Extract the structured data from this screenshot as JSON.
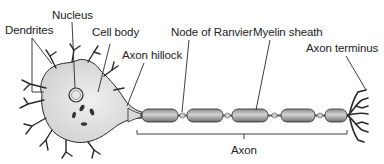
{
  "labels": {
    "dendrites": "Dendrites",
    "nucleus": "Nucleus",
    "cell_body": "Cell body",
    "axon_hillock": "Axon hillock",
    "node_of_ranvier": "Node of Ranvier",
    "myelin_sheath": "Myelin sheath",
    "axon_terminus": "Axon terminus",
    "axon": "Axon"
  },
  "colors": {
    "line": "#2a2a2a",
    "cell_fill": "#d9d9d9",
    "myelin_fill": "#9a9a9a",
    "myelin_highlight": "#d8d8d8",
    "background": "#ffffff"
  }
}
